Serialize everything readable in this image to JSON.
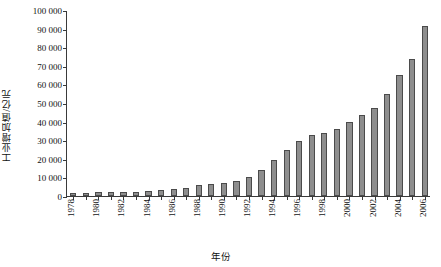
{
  "chart_data": {
    "type": "bar",
    "title": "",
    "xlabel": "年份",
    "ylabel": "工业增加值/亿元",
    "ylim": [
      0,
      100000
    ],
    "ytick_step": 10000,
    "grid": false,
    "legend": null,
    "bar_color": "#8e8e8e",
    "bar_edge_color": "#4b4b4b",
    "axis_color": "#3a3a3a",
    "ytick_labels": [
      "100 000",
      "90 000",
      "80 000",
      "70 000",
      "60 000",
      "50 000",
      "40 000",
      "30 000",
      "20 000",
      "10 000",
      "0"
    ],
    "ytick_values": [
      100000,
      90000,
      80000,
      70000,
      60000,
      50000,
      40000,
      30000,
      20000,
      10000,
      0
    ],
    "xtick_label_step": 2,
    "xtick_labels": [
      "1978",
      "1980",
      "1982",
      "1984",
      "1986",
      "1988",
      "1990",
      "1992",
      "1994",
      "1996",
      "1998",
      "2000",
      "2002",
      "2004",
      "2006"
    ],
    "categories": [
      "1978",
      "1979",
      "1980",
      "1981",
      "1982",
      "1983",
      "1984",
      "1985",
      "1986",
      "1987",
      "1988",
      "1989",
      "1990",
      "1991",
      "1992",
      "1993",
      "1994",
      "1995",
      "1996",
      "1997",
      "1998",
      "1999",
      "2000",
      "2001",
      "2002",
      "2003",
      "2004",
      "2005",
      "2006"
    ],
    "values": [
      1607,
      1770,
      1997,
      2048,
      2163,
      2375,
      2789,
      3449,
      3819,
      4492,
      5777,
      6484,
      6858,
      8087,
      10285,
      14188,
      19480,
      24950,
      29447,
      32921,
      34018,
      35861,
      40034,
      43581,
      47431,
      54945,
      65210,
      73904,
      91311
    ]
  }
}
